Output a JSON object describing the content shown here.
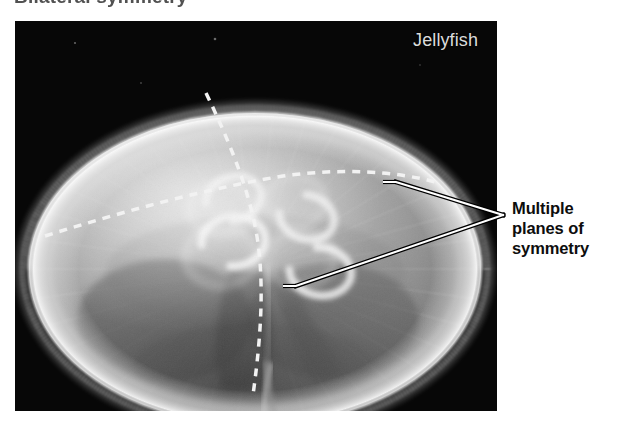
{
  "page": {
    "width": 619,
    "height": 432,
    "background_color": "#ffffff",
    "cropped_top_caption": "Bilateral symmetry"
  },
  "figure": {
    "photo": {
      "label": "Jellyfish",
      "label_color": "#dcdcdc",
      "background_color": "#050505",
      "bounds": {
        "x": 15,
        "y": 21,
        "width": 482,
        "height": 390
      },
      "subject": "moon jellyfish bell viewed from above",
      "dashed_line_color": "#f2f2f2"
    },
    "annotation": {
      "lines": [
        "Multiple",
        "planes of",
        "symmetry"
      ],
      "text_color": "#0d0d0d",
      "leader_color": "#ffffff",
      "leader_outline_color": "#000000",
      "apex": {
        "x": 503,
        "y": 215
      },
      "targets": [
        {
          "x": 396,
          "y": 182
        },
        {
          "x": 296,
          "y": 286
        }
      ]
    },
    "symmetry_planes": [
      {
        "name": "vertical-plane",
        "style": "dashed"
      },
      {
        "name": "transverse-plane",
        "style": "dashed"
      }
    ]
  }
}
